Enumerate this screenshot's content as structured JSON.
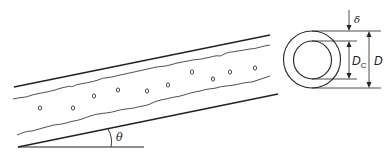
{
  "diagram": {
    "title": "",
    "pipe": {
      "angle_label": "θ",
      "bubble_glyph": "o",
      "bubbles": [
        {
          "x": 40,
          "y": 108
        },
        {
          "x": 73,
          "y": 108
        },
        {
          "x": 94,
          "y": 96
        },
        {
          "x": 118,
          "y": 90
        },
        {
          "x": 147,
          "y": 91
        },
        {
          "x": 168,
          "y": 85
        },
        {
          "x": 192,
          "y": 72
        },
        {
          "x": 213,
          "y": 79
        },
        {
          "x": 230,
          "y": 72
        },
        {
          "x": 255,
          "y": 68
        }
      ]
    },
    "cross_section": {
      "film_thickness_label": "δ",
      "core_diameter_label": "D",
      "core_diameter_subscript": "C",
      "pipe_diameter_label": "D"
    },
    "colors": {
      "stroke": "#222222",
      "background": "#ffffff"
    }
  }
}
